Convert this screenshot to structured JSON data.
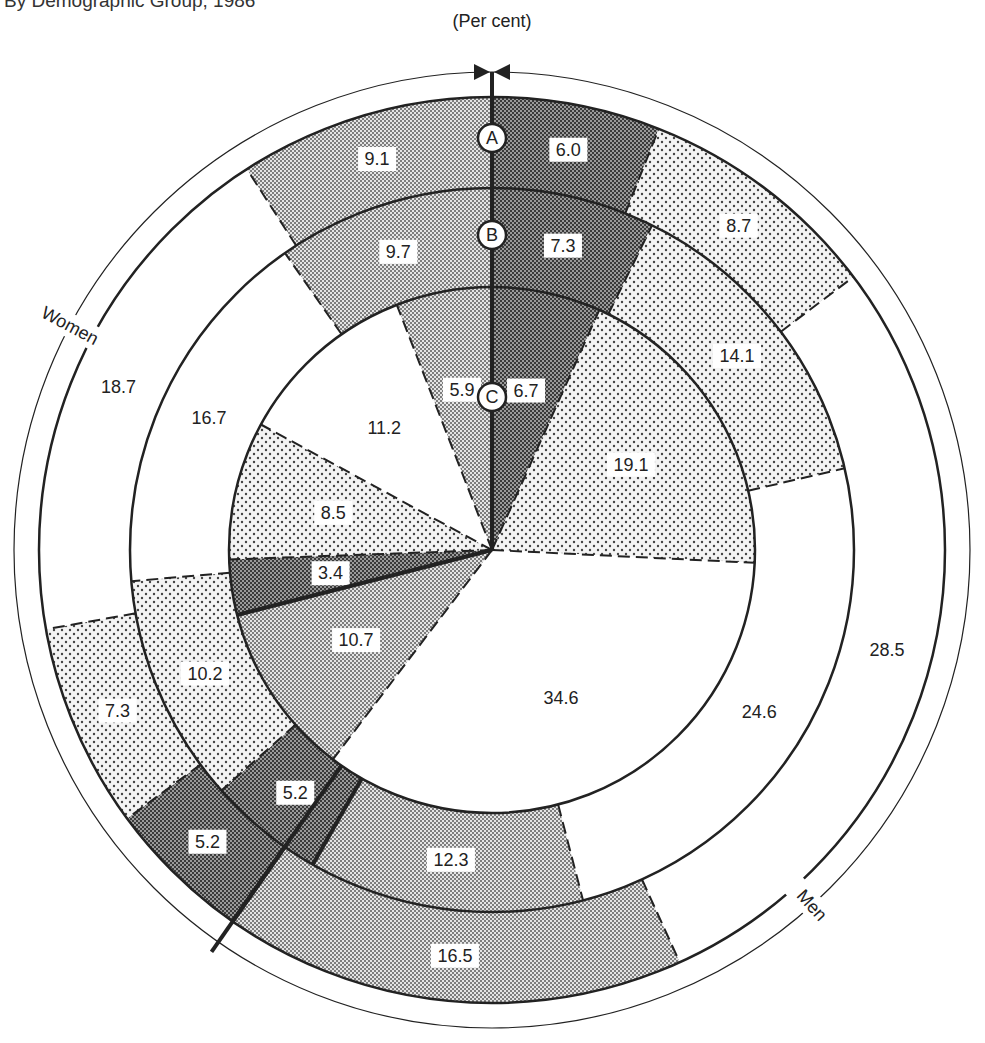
{
  "caption": "By Demographic Group, 1986",
  "unit_label": "(Per cent)",
  "ring_markers": [
    "A",
    "B",
    "C"
  ],
  "side_labels": {
    "men": "Men",
    "women": "Women"
  },
  "colors": {
    "dark": "#6a6a6a",
    "medium": "#b8b8b8",
    "light": "#dedede",
    "white": "#ffffff",
    "stroke": "#222222"
  },
  "chart_data": {
    "type": "pie",
    "subtype": "concentric-ring (nested donut)",
    "title": "(Per cent)",
    "center": [
      492,
      550
    ],
    "start_angle_deg": 0,
    "direction": "clockwise from top",
    "groups": [
      {
        "name": "Men",
        "segment_indices": [
          0,
          1,
          2,
          3
        ]
      },
      {
        "name": "Women",
        "segment_indices": [
          4,
          5,
          6,
          7
        ]
      }
    ],
    "segment_fills": [
      "dark",
      "light",
      "white",
      "medium",
      "dark",
      "light",
      "white",
      "medium"
    ],
    "rings": [
      {
        "name": "A",
        "inner_r": 362,
        "outer_r": 453,
        "values": [
          6.0,
          8.7,
          28.5,
          16.5,
          5.2,
          7.3,
          18.7,
          9.1
        ]
      },
      {
        "name": "B",
        "inner_r": 263,
        "outer_r": 362,
        "values": [
          7.3,
          14.1,
          24.6,
          12.3,
          5.2,
          10.2,
          16.7,
          9.7
        ]
      },
      {
        "name": "C",
        "inner_r": 0,
        "outer_r": 263,
        "values": [
          6.7,
          19.1,
          34.6,
          10.7,
          3.4,
          8.5,
          11.2,
          5.9
        ]
      }
    ],
    "labels": {
      "A": [
        "6.0",
        "8.7",
        "28.5",
        "16.5",
        "5.2",
        "7.3",
        "18.7",
        "9.1"
      ],
      "B": [
        "7.3",
        "14.1",
        "24.6",
        "12.3",
        "5.2",
        "10.2",
        "16.7",
        "9.7"
      ],
      "C": [
        "6.7",
        "19.1",
        "34.6",
        "10.7",
        "3.4",
        "8.5",
        "11.2",
        "5.9"
      ]
    },
    "legend": "none",
    "grid": false
  }
}
